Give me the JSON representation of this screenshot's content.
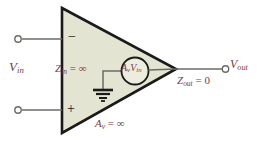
{
  "figure": {
    "background_color": "#ffffff",
    "triangle_fill": "#e3e4d2",
    "triangle_stroke": "#1a1a18",
    "wire_color": "#6b6b66",
    "label_color": "#7a3b46",
    "sign_color": "#20201e"
  },
  "labels": {
    "v_in": {
      "base": "V",
      "sub": "in"
    },
    "z_in": {
      "base": "Z",
      "sub": "in",
      "op": " = ",
      "value": "∞"
    },
    "dependent_source": {
      "gain_base": "A",
      "gain_sub": "v",
      "v_base": "V",
      "v_sub": "in"
    },
    "z_out": {
      "base": "Z",
      "sub": "out",
      "op": " = ",
      "value": "0"
    },
    "v_out": {
      "base": "V",
      "sub": "out"
    },
    "a_v": {
      "base": "A",
      "sub": "v",
      "op": " = ",
      "value": "∞"
    },
    "inverting_sign": "−",
    "noninverting_sign": "+"
  },
  "nodes": {
    "input_inverting_terminal": "open-circle-terminal",
    "input_noninverting_terminal": "open-circle-terminal",
    "output_terminal": "open-circle-terminal",
    "ground": "ground-symbol"
  }
}
